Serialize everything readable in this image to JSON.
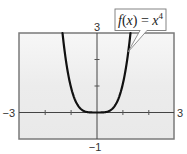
{
  "chart_data": {
    "type": "line",
    "title": "",
    "xlabel": "",
    "ylabel": "",
    "xlim": [
      -3,
      3
    ],
    "ylim": [
      -1,
      3
    ],
    "grid": false,
    "x_ticks": [
      -2,
      -1,
      1,
      2
    ],
    "y_ticks": [
      1,
      2
    ],
    "tick_labels": {
      "x_min": "−3",
      "x_max": "3",
      "y_min": "−1",
      "y_max": "3"
    },
    "series": [
      {
        "name": "f(x) = x^4",
        "function": "x^4",
        "x": [
          -1.316,
          -1.2,
          -1.0,
          -0.8,
          -0.6,
          -0.4,
          -0.2,
          0,
          0.2,
          0.4,
          0.6,
          0.8,
          1.0,
          1.2,
          1.316
        ],
        "y": [
          3.0,
          2.0736,
          1.0,
          0.4096,
          0.1296,
          0.0256,
          0.0016,
          0,
          0.0016,
          0.0256,
          0.1296,
          0.4096,
          1.0,
          2.0736,
          3.0
        ]
      }
    ],
    "annotations": [
      {
        "text": "f(x) = x⁴",
        "type": "callout",
        "points_to_x": 1.3,
        "points_to_y": 2.3
      }
    ]
  },
  "labels": {
    "x_min": "−3",
    "x_max": "3",
    "y_min": "−1",
    "y_max": "3",
    "fn_f": "f",
    "fn_paren_open": "(",
    "fn_x": "x",
    "fn_paren_close": ")",
    "fn_eq": " = ",
    "fn_base": "x",
    "fn_exp": "4"
  },
  "colors": {
    "curve": "#111111",
    "frame": "#7a7a7a",
    "axis": "#444444",
    "plot_bg": "#f2f2f2"
  }
}
